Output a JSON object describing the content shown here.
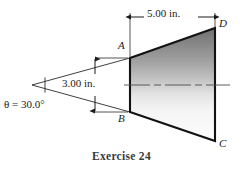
{
  "figure": {
    "caption": "Exercise 24",
    "dimensions": {
      "top_length": "5.00 in.",
      "side_height": "3.00 in.",
      "angle": "θ = 30.0°"
    },
    "vertices": {
      "a": "A",
      "b": "B",
      "c": "C",
      "d": "D"
    },
    "colors": {
      "outline": "#1a1a1a",
      "gradient_top": "#7e7e7e",
      "gradient_bottom": "#fdfdfd",
      "centerline": "#555555",
      "caption_color": "#3a3a3a"
    },
    "geometry": {
      "apex_x": 32,
      "apex_y": 85,
      "a_x": 130,
      "a_y": 58,
      "b_x": 130,
      "b_y": 112,
      "c_x": 215,
      "c_y": 141,
      "d_x": 215,
      "d_y": 28,
      "centerline_y": 85,
      "dim_top_y": 17,
      "dim_side_x": 95
    }
  }
}
